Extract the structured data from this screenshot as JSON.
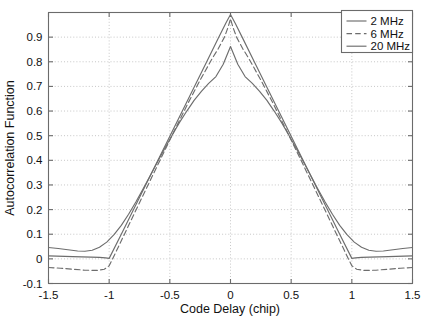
{
  "chart_data": {
    "type": "line",
    "title": "",
    "xlabel": "Code Delay (chip)",
    "ylabel": "Autocorrelation Function",
    "xlim": [
      -1.5,
      1.5
    ],
    "ylim": [
      -0.1,
      1.0
    ],
    "xticks": [
      -1.5,
      -1,
      -0.5,
      0,
      0.5,
      1,
      1.5
    ],
    "xticklabels": [
      "-1.5",
      "-1",
      "-0.5",
      "0",
      "0.5",
      "1",
      "1.5"
    ],
    "yticks": [
      -0.1,
      0,
      0.1,
      0.2,
      0.3,
      0.4,
      0.5,
      0.6,
      0.7,
      0.8,
      0.9
    ],
    "yticklabels": [
      "-0.1",
      "0",
      "0.1",
      "0.2",
      "0.3",
      "0.4",
      "0.5",
      "0.6",
      "0.7",
      "0.8",
      "0.9"
    ],
    "grid": true,
    "legend_position": "top-right",
    "line_color": "#6d6d6d",
    "series": [
      {
        "name": "2 MHz",
        "style": "solid",
        "x": [
          -1.5,
          -1.42,
          -1.34,
          -1.26,
          -1.2,
          -1.14,
          -1.08,
          -1.02,
          -0.96,
          -0.9,
          -0.84,
          -0.78,
          -0.72,
          -0.66,
          -0.6,
          -0.54,
          -0.48,
          -0.42,
          -0.36,
          -0.3,
          -0.24,
          -0.18,
          -0.12,
          -0.06,
          0,
          0.06,
          0.12,
          0.18,
          0.24,
          0.3,
          0.36,
          0.42,
          0.48,
          0.54,
          0.6,
          0.66,
          0.72,
          0.78,
          0.84,
          0.9,
          0.96,
          1.02,
          1.08,
          1.14,
          1.2,
          1.26,
          1.34,
          1.42,
          1.5
        ],
        "y": [
          0.046,
          0.042,
          0.037,
          0.032,
          0.031,
          0.035,
          0.047,
          0.068,
          0.098,
          0.136,
          0.181,
          0.231,
          0.284,
          0.339,
          0.395,
          0.45,
          0.503,
          0.554,
          0.6,
          0.643,
          0.68,
          0.712,
          0.74,
          0.79,
          0.862,
          0.79,
          0.74,
          0.712,
          0.68,
          0.643,
          0.6,
          0.554,
          0.503,
          0.45,
          0.395,
          0.339,
          0.284,
          0.231,
          0.181,
          0.136,
          0.098,
          0.068,
          0.047,
          0.035,
          0.031,
          0.032,
          0.037,
          0.042,
          0.046
        ]
      },
      {
        "name": "6 MHz",
        "style": "dashed",
        "x": [
          -1.5,
          -1.4,
          -1.3,
          -1.2,
          -1.1,
          -1.04,
          -1,
          -0.95,
          -0.85,
          -0.75,
          -0.65,
          -0.55,
          -0.45,
          -0.35,
          -0.25,
          -0.15,
          -0.1,
          -0.05,
          -0.02,
          0,
          0.02,
          0.05,
          0.1,
          0.15,
          0.25,
          0.35,
          0.45,
          0.55,
          0.65,
          0.75,
          0.85,
          0.95,
          1,
          1.04,
          1.1,
          1.2,
          1.3,
          1.4,
          1.5
        ],
        "y": [
          -0.035,
          -0.038,
          -0.042,
          -0.046,
          -0.047,
          -0.042,
          -0.028,
          0.022,
          0.125,
          0.228,
          0.33,
          0.432,
          0.533,
          0.632,
          0.726,
          0.814,
          0.854,
          0.9,
          0.94,
          0.975,
          0.94,
          0.9,
          0.854,
          0.814,
          0.726,
          0.632,
          0.533,
          0.432,
          0.33,
          0.228,
          0.125,
          0.022,
          -0.028,
          -0.042,
          -0.047,
          -0.046,
          -0.042,
          -0.038,
          -0.035
        ]
      },
      {
        "name": "20 MHz",
        "style": "solid",
        "x": [
          -1.5,
          -1.3,
          -1.15,
          -1.08,
          -1.03,
          -1,
          -0.9,
          -0.8,
          -0.7,
          -0.6,
          -0.5,
          -0.4,
          -0.3,
          -0.2,
          -0.1,
          -0.04,
          0,
          0.04,
          0.1,
          0.2,
          0.3,
          0.4,
          0.5,
          0.6,
          0.7,
          0.8,
          0.9,
          1,
          1.03,
          1.08,
          1.15,
          1.3,
          1.5
        ],
        "y": [
          0.012,
          0.009,
          0.007,
          0.006,
          0.004,
          0.002,
          0.1,
          0.199,
          0.299,
          0.398,
          0.498,
          0.597,
          0.697,
          0.796,
          0.896,
          0.955,
          0.992,
          0.955,
          0.896,
          0.796,
          0.697,
          0.597,
          0.498,
          0.398,
          0.299,
          0.199,
          0.1,
          0.002,
          0.004,
          0.006,
          0.007,
          0.009,
          0.012
        ]
      }
    ]
  },
  "legend": {
    "entries": [
      {
        "label": "2 MHz",
        "style": "solid"
      },
      {
        "label": "6 MHz",
        "style": "dashed"
      },
      {
        "label": "20 MHz",
        "style": "solid"
      }
    ]
  }
}
